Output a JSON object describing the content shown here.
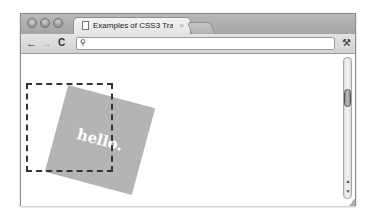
{
  "browser": {
    "tab": {
      "title": "Examples of CSS3 Transforms",
      "close_glyph": "×"
    },
    "toolbar": {
      "back_glyph": "←",
      "forward_glyph": "→",
      "reload_glyph": "C",
      "search_glyph": "⚲",
      "address": "",
      "wrench_glyph": "⚒"
    },
    "scrollbar": {
      "up_glyph": "▲",
      "down_glyph": "▼"
    }
  },
  "page": {
    "box_text": "hello.",
    "box_color": "#b4b4b4",
    "outline_color": "#333333",
    "rotation_deg": 15
  }
}
